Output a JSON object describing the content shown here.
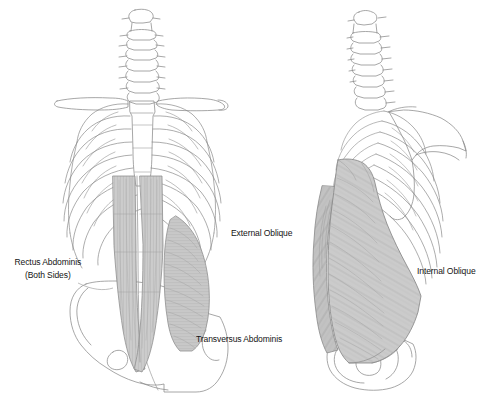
{
  "illustration": {
    "title": "Abdominal musculature anatomical illustration",
    "view_left": "Anterior view of trunk skeleton with rectus abdominis and transversus abdominis",
    "view_right": "Lateral oblique view of trunk skeleton with external and internal oblique muscles",
    "background_color": "#ffffff",
    "line_color": "#8a8a8a",
    "muscle_fill_color": "#c9c9c9",
    "muscle_shadow_color": "#a8a8a8",
    "text_color": "#141414"
  },
  "labels": {
    "rectus_abdominis": {
      "line1": "Rectus Abdominis",
      "line2": "(Both Sides)"
    },
    "transversus_abdominis": "Transversus Abdominis",
    "external_oblique": "External Oblique",
    "internal_oblique": "Internal Oblique"
  }
}
